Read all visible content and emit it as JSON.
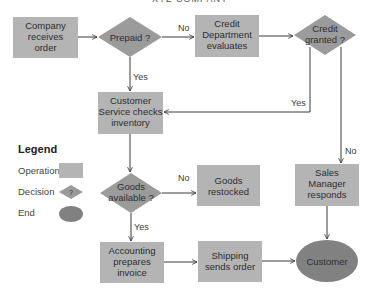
{
  "title": "XYZ COMPANY",
  "colors": {
    "operation": "#b4b4b4",
    "decision": "#9b9b9b",
    "end": "#818181",
    "line": "#3a3a3a",
    "background": "#ffffff"
  },
  "nodes": {
    "company_receives_order": {
      "type": "operation",
      "lines": [
        "Company",
        "receives",
        "order"
      ]
    },
    "prepaid": {
      "type": "decision",
      "lines": [
        "Prepaid ?"
      ]
    },
    "credit_department": {
      "type": "operation",
      "lines": [
        "Credit",
        "Department",
        "evaluates"
      ]
    },
    "credit_granted": {
      "type": "decision",
      "lines": [
        "Credit",
        "granted ?"
      ]
    },
    "customer_service": {
      "type": "operation",
      "lines": [
        "Customer",
        "Service checks",
        "inventory"
      ]
    },
    "goods_available": {
      "type": "decision",
      "lines": [
        "Goods",
        "available ?"
      ]
    },
    "goods_restocked": {
      "type": "operation",
      "lines": [
        "Goods",
        "restocked"
      ]
    },
    "sales_manager": {
      "type": "operation",
      "lines": [
        "Sales",
        "Manager",
        "responds"
      ]
    },
    "accounting": {
      "type": "operation",
      "lines": [
        "Accounting",
        "prepares",
        "invoice"
      ]
    },
    "shipping": {
      "type": "operation",
      "lines": [
        "Shipping",
        "sends order"
      ]
    },
    "customer": {
      "type": "end",
      "lines": [
        "Customer"
      ]
    }
  },
  "edges": [
    {
      "from": "company_receives_order",
      "to": "prepaid",
      "label": ""
    },
    {
      "from": "prepaid",
      "to": "credit_department",
      "label": "No"
    },
    {
      "from": "prepaid",
      "to": "customer_service",
      "label": "Yes"
    },
    {
      "from": "credit_department",
      "to": "credit_granted",
      "label": ""
    },
    {
      "from": "credit_granted",
      "to": "customer_service",
      "label": "Yes"
    },
    {
      "from": "credit_granted",
      "to": "sales_manager",
      "label": "No"
    },
    {
      "from": "customer_service",
      "to": "goods_available",
      "label": ""
    },
    {
      "from": "goods_available",
      "to": "goods_restocked",
      "label": "No"
    },
    {
      "from": "goods_available",
      "to": "accounting",
      "label": "Yes"
    },
    {
      "from": "accounting",
      "to": "shipping",
      "label": ""
    },
    {
      "from": "shipping",
      "to": "customer",
      "label": ""
    },
    {
      "from": "sales_manager",
      "to": "customer",
      "label": ""
    }
  ],
  "edge_labels": {
    "prepaid_no": "No",
    "prepaid_yes": "Yes",
    "credit_yes": "Yes",
    "credit_no": "No",
    "goods_no": "No",
    "goods_yes": "Yes"
  },
  "legend": {
    "title": "Legend",
    "items": [
      {
        "label": "Operation",
        "shape": "rectangle"
      },
      {
        "label": "Decision",
        "shape": "diamond",
        "symbol": "?"
      },
      {
        "label": "End",
        "shape": "ellipse"
      }
    ]
  }
}
